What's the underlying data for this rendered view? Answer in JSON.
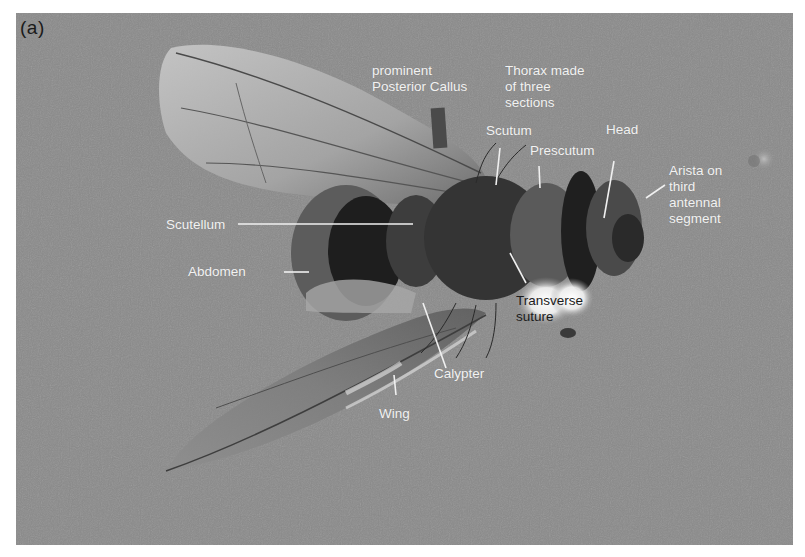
{
  "figure": {
    "panel_label": "(a)",
    "colors": {
      "background": "#8a8a8a",
      "label_text": "#f2f2f2",
      "dark_label_text": "#1c1c1c",
      "leader_line": "#f0f0f0"
    },
    "labels": {
      "posterior_callus": "prominent\nPosterior Callus",
      "thorax": "Thorax made\nof three\nsections",
      "scutum": "Scutum",
      "prescutum": "Prescutum",
      "head": "Head",
      "arista": "Arista on\nthird\nantennal\nsegment",
      "scutellum": "Scutellum",
      "abdomen": "Abdomen",
      "transverse_suture": "Transverse\nsuture",
      "calypter": "Calypter",
      "wing": "Wing"
    }
  }
}
